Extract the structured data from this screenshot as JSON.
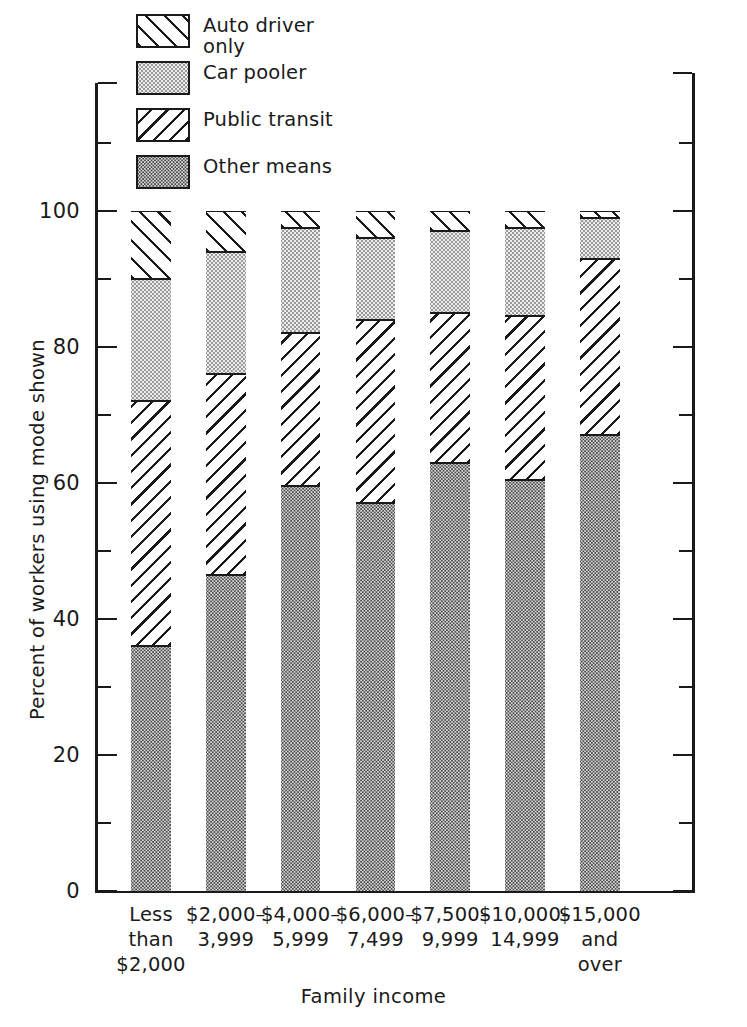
{
  "chart_data": {
    "type": "bar",
    "subtype": "stacked-vertical-100",
    "title": "",
    "xlabel": "Family income",
    "ylabel": "Percent of workers using mode shown",
    "ylim": [
      0,
      115
    ],
    "grid": false,
    "legend_position": "top-left",
    "y_major_ticks": [
      0,
      20,
      40,
      60,
      80,
      100
    ],
    "y_minor_ticks": [
      10,
      30,
      50,
      70,
      90,
      110
    ],
    "y_tick_labels": [
      "0",
      "20",
      "40",
      "60",
      "80",
      "100"
    ],
    "categories": [
      "Less\nthan\n$2,000",
      "$2,000–\n3,999",
      "$4,000–\n5,999",
      "$6,000–\n7,499",
      "$7,500–\n9,999",
      "$10,000–\n14,999",
      "$15,000\nand\nover"
    ],
    "series": [
      {
        "name": "Other means",
        "pattern": "dark-stipple",
        "values": [
          36.0,
          46.5,
          59.5,
          57.0,
          63.0,
          60.5,
          67.0
        ]
      },
      {
        "name": "Public transit",
        "pattern": "backslash-hatch",
        "values": [
          36.0,
          29.5,
          22.5,
          27.0,
          22.0,
          24.0,
          26.0
        ]
      },
      {
        "name": "Car pooler",
        "pattern": "light-stipple",
        "values": [
          18.0,
          18.0,
          15.5,
          12.0,
          12.0,
          13.0,
          6.0
        ]
      },
      {
        "name": "Auto driver only",
        "pattern": "slash-hatch",
        "values": [
          10.0,
          6.0,
          2.5,
          4.0,
          3.0,
          2.5,
          1.0
        ]
      }
    ],
    "cumulative_tops": [
      [
        36.0,
        72.0,
        90.0,
        100.0
      ],
      [
        46.5,
        76.0,
        94.0,
        100.0
      ],
      [
        59.5,
        82.0,
        97.5,
        100.0
      ],
      [
        57.0,
        84.0,
        96.0,
        100.0
      ],
      [
        63.0,
        85.0,
        97.0,
        100.0
      ],
      [
        60.5,
        84.5,
        97.5,
        100.0
      ],
      [
        67.0,
        93.0,
        99.0,
        100.0
      ]
    ]
  },
  "legend": {
    "items": [
      {
        "label": "Auto driver\n   only",
        "pattern": "slash-hatch"
      },
      {
        "label": "Car pooler",
        "pattern": "light-stipple"
      },
      {
        "label": "Public transit",
        "pattern": "backslash-hatch"
      },
      {
        "label": "Other means",
        "pattern": "dark-stipple"
      }
    ]
  },
  "axes": {
    "x_title": "Family income",
    "y_title": "Percent of workers using mode shown",
    "y_labels": [
      "100",
      "80",
      "60",
      "40",
      "20",
      "0"
    ]
  },
  "colors": {
    "ink": "#1a1a1a",
    "background": "#ffffff",
    "car_pooler_fill": "#ececed",
    "other_means_fill": "#d8d8d8"
  }
}
